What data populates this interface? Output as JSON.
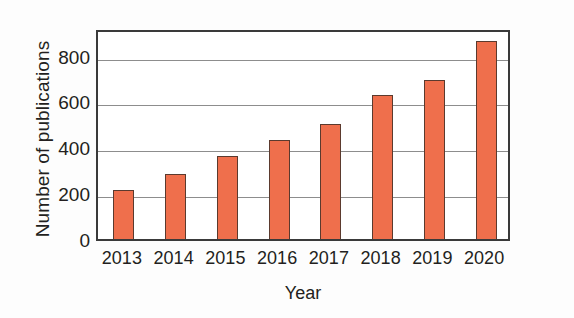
{
  "chart_data": {
    "type": "bar",
    "title": "",
    "xlabel": "Year",
    "ylabel": "Number of publications",
    "categories": [
      "2013",
      "2014",
      "2015",
      "2016",
      "2017",
      "2018",
      "2019",
      "2020"
    ],
    "values": [
      215,
      283,
      363,
      433,
      500,
      630,
      692,
      862
    ],
    "ylim": [
      0,
      920
    ],
    "yticks": [
      0,
      200,
      400,
      600,
      800
    ],
    "ytick_labels": [
      "0",
      "200",
      "400",
      "600",
      "800"
    ],
    "grid": "horizontal",
    "legend": "none",
    "colors": {
      "bar_fill": "#ef6f4c",
      "bar_edge": "#5b3a2e",
      "gridline": "#8d8d8d",
      "frame": "#3a3a3a",
      "text": "#231f20",
      "background": "#ffffff"
    }
  }
}
